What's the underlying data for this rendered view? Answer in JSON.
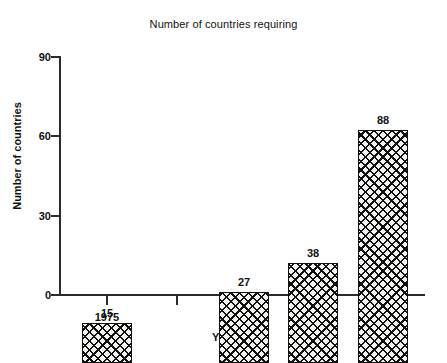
{
  "chart_data": {
    "type": "bar",
    "title": "Number of countries requiring",
    "xlabel": "Year",
    "ylabel": "Number of countries",
    "categories": [
      "1975",
      "1982",
      "1983",
      "1984"
    ],
    "values": [
      15,
      27,
      38,
      88
    ],
    "value_labels": [
      "15",
      "27",
      "38",
      "88"
    ],
    "ylim": [
      0,
      90
    ],
    "yticks": [
      0,
      30,
      60,
      90
    ],
    "ytick_labels": [
      "0",
      "30",
      "60",
      "90"
    ],
    "xtick_labels": [
      "1975",
      "",
      "1982",
      "1983",
      "1984"
    ],
    "grid": false,
    "legend": null,
    "bar_fill": "#f2f2ef",
    "bar_hatch": "crosshatch-xx",
    "bar_edge_color": "#111111",
    "axis_color": "#2b2b2b",
    "background": "#ffffff"
  }
}
